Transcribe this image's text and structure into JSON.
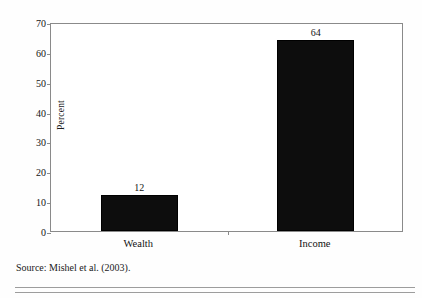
{
  "chart_data": {
    "type": "bar",
    "title": "",
    "subtitle": "",
    "xlabel": "",
    "ylabel": "Percent",
    "categories": [
      "Wealth",
      "Income"
    ],
    "values": [
      12,
      64
    ],
    "value_labels": [
      "12",
      "64"
    ],
    "ylim": [
      0,
      70
    ],
    "y_ticks": [
      0,
      10,
      20,
      30,
      40,
      50,
      60,
      70
    ],
    "y_tick_labels": [
      "0",
      "10",
      "20",
      "30",
      "40",
      "50",
      "60",
      "70"
    ],
    "grid": false,
    "legend": null,
    "legend_position": "none",
    "series": [
      {
        "name": "Share",
        "values": [
          12,
          64
        ]
      }
    ],
    "bar_color": "#0d0d0d",
    "axis_color": "#8a8a8a",
    "background_color": "#ffffff"
  },
  "figure": {
    "source_note": "Source: Mishel et al. (2003)."
  }
}
